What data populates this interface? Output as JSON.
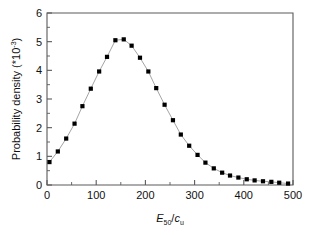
{
  "chart_data": {
    "type": "line",
    "title": "",
    "subtitle": "",
    "xlabel": "E50/cu",
    "xlabel_parts": {
      "main": "E",
      "main_sub": "50",
      "separator": "/",
      "second": "c",
      "second_sub": "u"
    },
    "ylabel": "Probability density (*10-3)",
    "ylabel_parts": {
      "text": "Probability density (*10",
      "exponent": "-3",
      "tail": ")"
    },
    "xlim": [
      0,
      500
    ],
    "ylim": [
      0,
      6
    ],
    "xticks": [
      0,
      100,
      200,
      300,
      400,
      500
    ],
    "yticks": [
      0,
      1,
      2,
      3,
      4,
      5,
      6
    ],
    "xtick_labels": [
      "0",
      "100",
      "200",
      "300",
      "400",
      "500"
    ],
    "ytick_labels": [
      "0",
      "1",
      "2",
      "3",
      "4",
      "5",
      "6"
    ],
    "x_minor_interval": 50,
    "y_minor_interval": 0.5,
    "grid": false,
    "legend": false,
    "marker": "square",
    "marker_color": "#000000",
    "line_color": "#9a9a9a",
    "background_color": "#ffffff",
    "axis_color": "#5a5a5a",
    "series": [
      {
        "name": "Probability density",
        "x": [
          5,
          22,
          39,
          56,
          72,
          89,
          106,
          122,
          139,
          156,
          172,
          189,
          206,
          222,
          239,
          256,
          272,
          289,
          306,
          322,
          339,
          356,
          372,
          389,
          406,
          422,
          439,
          456,
          472,
          490
        ],
        "values": [
          0.8,
          1.17,
          1.62,
          2.14,
          2.75,
          3.36,
          3.96,
          4.47,
          5.05,
          5.08,
          4.86,
          4.44,
          3.96,
          3.38,
          2.8,
          2.26,
          1.76,
          1.37,
          1.05,
          0.78,
          0.58,
          0.43,
          0.33,
          0.26,
          0.2,
          0.16,
          0.13,
          0.11,
          0.08,
          0.05
        ]
      }
    ]
  },
  "figure": {
    "plot_area": {
      "left": 47,
      "right": 293,
      "top": 13,
      "bottom": 185
    }
  }
}
